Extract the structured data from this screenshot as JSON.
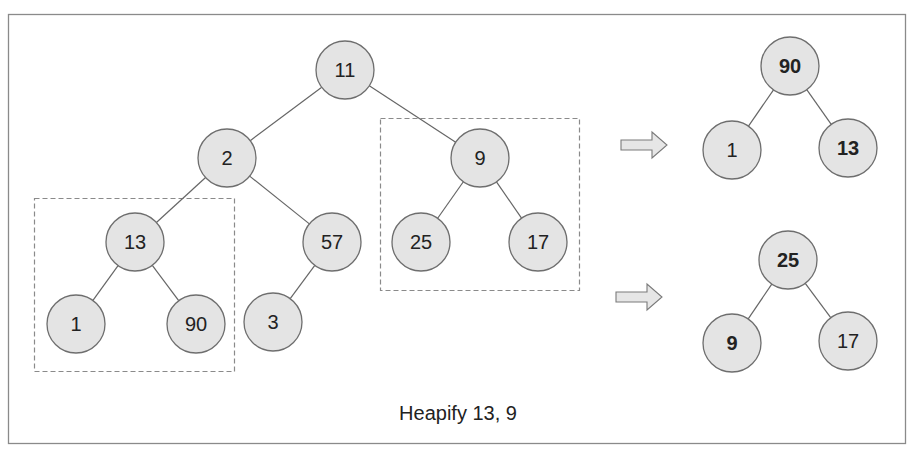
{
  "diagram": {
    "caption": "Heapify 13, 9",
    "colors": {
      "node_fill": "#e4e4e4",
      "node_stroke": "#6e6e6e",
      "edge": "#666666",
      "frame": "#8a8a8a",
      "dashed_box": "#8a8a8a",
      "arrow_fill": "#e6e6e6",
      "arrow_stroke": "#7a7a7a"
    },
    "main_tree": {
      "nodes": [
        {
          "id": "n11",
          "label": "11",
          "x": 345,
          "y": 70
        },
        {
          "id": "n2",
          "label": "2",
          "x": 227,
          "y": 158
        },
        {
          "id": "n9",
          "label": "9",
          "x": 480,
          "y": 158
        },
        {
          "id": "n13",
          "label": "13",
          "x": 135,
          "y": 242
        },
        {
          "id": "n57",
          "label": "57",
          "x": 332,
          "y": 242
        },
        {
          "id": "n25",
          "label": "25",
          "x": 421,
          "y": 242
        },
        {
          "id": "n17",
          "label": "17",
          "x": 538,
          "y": 242
        },
        {
          "id": "n1",
          "label": "1",
          "x": 76,
          "y": 324
        },
        {
          "id": "n90",
          "label": "90",
          "x": 196,
          "y": 324
        },
        {
          "id": "n3",
          "label": "3",
          "x": 273,
          "y": 322
        }
      ],
      "edges": [
        [
          "n11",
          "n2"
        ],
        [
          "n11",
          "n9"
        ],
        [
          "n2",
          "n13"
        ],
        [
          "n2",
          "n57"
        ],
        [
          "n9",
          "n25"
        ],
        [
          "n9",
          "n17"
        ],
        [
          "n13",
          "n1"
        ],
        [
          "n13",
          "n90"
        ],
        [
          "n57",
          "n3"
        ]
      ]
    },
    "highlight_boxes": [
      {
        "id": "subtree-13-box",
        "x": 34,
        "y": 198,
        "w": 200,
        "h": 173
      },
      {
        "id": "subtree-9-box",
        "x": 380,
        "y": 118,
        "w": 199,
        "h": 172
      }
    ],
    "arrows": [
      {
        "id": "arrow-to-result-1",
        "x": 621,
        "y": 145
      },
      {
        "id": "arrow-to-result-2",
        "x": 616,
        "y": 297
      }
    ],
    "result_trees": [
      {
        "id": "heapified-13",
        "nodes": [
          {
            "id": "r1_90",
            "label": "90",
            "x": 790,
            "y": 66,
            "bold": true
          },
          {
            "id": "r1_1",
            "label": "1",
            "x": 732,
            "y": 150,
            "bold": false
          },
          {
            "id": "r1_13",
            "label": "13",
            "x": 848,
            "y": 148,
            "bold": true
          }
        ],
        "edges": [
          [
            "r1_90",
            "r1_1"
          ],
          [
            "r1_90",
            "r1_13"
          ]
        ]
      },
      {
        "id": "heapified-9",
        "nodes": [
          {
            "id": "r2_25",
            "label": "25",
            "x": 788,
            "y": 260,
            "bold": true
          },
          {
            "id": "r2_9",
            "label": "9",
            "x": 732,
            "y": 343,
            "bold": true
          },
          {
            "id": "r2_17",
            "label": "17",
            "x": 848,
            "y": 341,
            "bold": false
          }
        ],
        "edges": [
          [
            "r2_25",
            "r2_9"
          ],
          [
            "r2_25",
            "r2_17"
          ]
        ]
      }
    ]
  }
}
